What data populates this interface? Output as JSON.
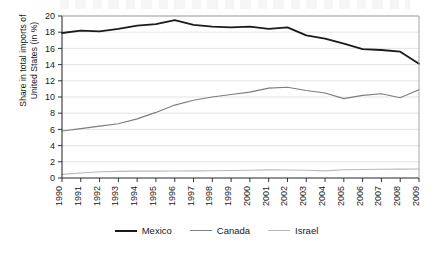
{
  "chart_data": {
    "type": "line",
    "title": "",
    "xlabel": "",
    "ylabel": "Share in total imports of\nUnited States (in %)",
    "ylim": [
      0,
      20
    ],
    "yticks": [
      0,
      2,
      4,
      6,
      8,
      10,
      12,
      14,
      16,
      18,
      20
    ],
    "grid": true,
    "legend_position": "bottom-center",
    "categories": [
      "1990",
      "1991",
      "1992",
      "1993",
      "1994",
      "1995",
      "1996",
      "1997",
      "1998",
      "1999",
      "2000",
      "2001",
      "2002",
      "2003",
      "2004",
      "2005",
      "2006",
      "2007",
      "2008",
      "2009"
    ],
    "series": [
      {
        "name": "Mexico",
        "color": "#1a1a1a",
        "values": [
          17.9,
          18.2,
          18.1,
          18.4,
          18.8,
          19.0,
          19.5,
          18.9,
          18.7,
          18.6,
          18.7,
          18.4,
          18.6,
          17.6,
          17.2,
          16.6,
          15.9,
          15.8,
          15.6,
          14.1
        ]
      },
      {
        "name": "Canada",
        "color": "#7d7d7d",
        "values": [
          5.8,
          6.1,
          6.4,
          6.7,
          7.3,
          8.1,
          9.0,
          9.6,
          10.0,
          10.3,
          10.6,
          11.1,
          11.2,
          10.8,
          10.5,
          9.8,
          10.2,
          10.4,
          9.9,
          10.9
        ]
      },
      {
        "name": "Israel",
        "color": "#b9b9b9",
        "values": [
          0.45,
          0.62,
          0.78,
          0.82,
          0.85,
          0.85,
          0.86,
          0.88,
          0.9,
          0.92,
          0.95,
          1.0,
          0.98,
          0.95,
          0.88,
          1.02,
          1.05,
          1.08,
          1.1,
          1.12
        ]
      }
    ]
  },
  "legend": {
    "items": [
      {
        "label": "Mexico",
        "color": "#1a1a1a"
      },
      {
        "label": "Canada",
        "color": "#7d7d7d"
      },
      {
        "label": "Israel",
        "color": "#b9b9b9"
      }
    ]
  }
}
